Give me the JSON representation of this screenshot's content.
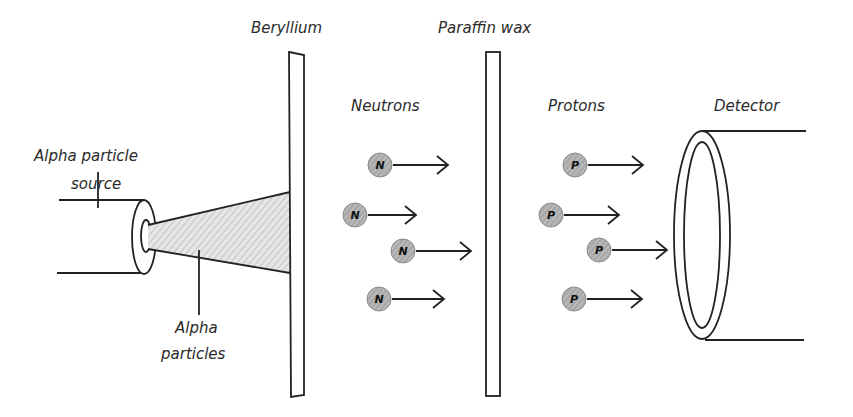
{
  "labels": {
    "source": [
      "Alpha particle",
      "source"
    ],
    "beryllium": "Beryllium",
    "paraffin": "Paraffin wax",
    "neutrons": "Neutrons",
    "protons": "Protons",
    "detector": "Detector",
    "alpha_particles": [
      "Alpha",
      "particles"
    ]
  },
  "neutrons": [
    {
      "x": 380,
      "y": 165,
      "arrow_len": 55,
      "symbol": "N"
    },
    {
      "x": 355,
      "y": 215,
      "arrow_len": 48,
      "symbol": "N"
    },
    {
      "x": 403,
      "y": 251,
      "arrow_len": 55,
      "symbol": "N"
    },
    {
      "x": 379,
      "y": 299,
      "arrow_len": 52,
      "symbol": "N"
    }
  ],
  "protons": [
    {
      "x": 575,
      "y": 165,
      "arrow_len": 55,
      "symbol": "P"
    },
    {
      "x": 551,
      "y": 215,
      "arrow_len": 55,
      "symbol": "P"
    },
    {
      "x": 599,
      "y": 250,
      "arrow_len": 55,
      "symbol": "P"
    },
    {
      "x": 574,
      "y": 299,
      "arrow_len": 55,
      "symbol": "P"
    }
  ],
  "colors": {
    "ink": "#222222",
    "particle_fill": "#a8a8a8",
    "beam_fill": "#d8d8d8"
  }
}
